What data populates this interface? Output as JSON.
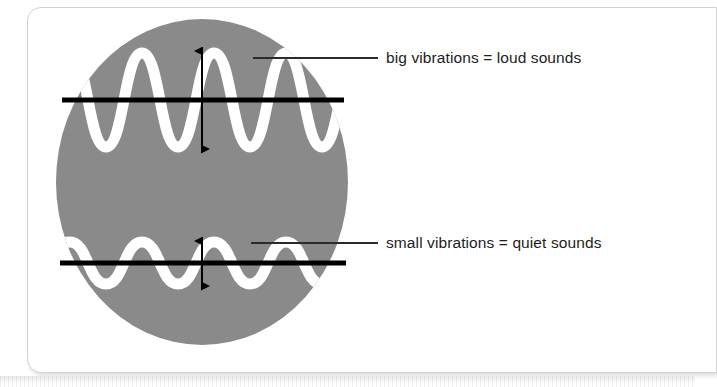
{
  "page": {
    "background_color": "#ffffff",
    "sheet_color": "#ffffff",
    "sheet_border_color": "#d2d2d2"
  },
  "figure": {
    "name": "amplitude-diagram",
    "circle_color": "#8a8a8a",
    "wave_color": "#ffffff",
    "axis_color": "#000000",
    "arrow_color": "#000000",
    "leader_color": "#2b2b2b",
    "circle": {
      "cx": 202,
      "cy": 182,
      "rx": 146,
      "ry": 163
    },
    "waves": [
      {
        "name": "loud-wave",
        "description": "large amplitude waveform",
        "baseline_y": 100,
        "amplitude": 47,
        "cycles": 2.5,
        "stroke_width": 11
      },
      {
        "name": "quiet-wave",
        "description": "small amplitude waveform",
        "baseline_y": 263,
        "amplitude": 21,
        "cycles": 2.5,
        "stroke_width": 11
      }
    ],
    "baselines": [
      {
        "name": "loud-baseline",
        "y": 100,
        "x1": 62,
        "x2": 344
      },
      {
        "name": "quiet-baseline",
        "y": 263,
        "x1": 60,
        "x2": 346
      }
    ],
    "amplitude_arrows": [
      {
        "name": "loud-amplitude-arrow",
        "x": 202,
        "y1": 50,
        "y2": 150
      },
      {
        "name": "quiet-amplitude-arrow",
        "x": 202,
        "y1": 240,
        "y2": 287
      }
    ],
    "leaders": [
      {
        "name": "loud-leader-line",
        "x1": 253,
        "y1": 58,
        "x2": 378,
        "y2": 58
      },
      {
        "name": "quiet-leader-line",
        "x1": 251,
        "y1": 243,
        "x2": 378,
        "y2": 243
      }
    ]
  },
  "labels": {
    "loud": "big vibrations = loud sounds",
    "quiet": "small vibrations = quiet sounds"
  }
}
